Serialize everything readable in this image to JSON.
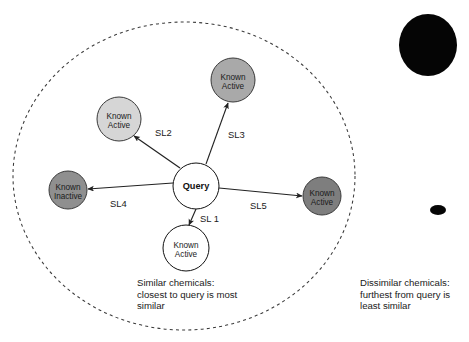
{
  "diagram": {
    "boundary": {
      "name": "similarity-boundary-ellipse",
      "style": "dashed",
      "cx": 184,
      "cy": 176,
      "rx": 171,
      "ry": 154,
      "color": "#3a3a3a"
    },
    "query_node": {
      "label": "Query",
      "cx": 196,
      "cy": 186,
      "r": 23,
      "fill": "#ffffff",
      "stroke": "#111111"
    },
    "nodes": [
      {
        "id": "known-active-upper-left",
        "line1": "Known",
        "line2": "Active",
        "cx": 119,
        "cy": 119,
        "r": 22,
        "fill": "#d6d6d6",
        "stroke": "#3a3a3a"
      },
      {
        "id": "known-active-top",
        "line1": "Known",
        "line2": "Active",
        "cx": 233,
        "cy": 80,
        "r": 22,
        "fill": "#a9a9a9",
        "stroke": "#3a3a3a"
      },
      {
        "id": "known-inactive-left",
        "line1": "Known",
        "line2": "Inactive",
        "cx": 68,
        "cy": 190,
        "r": 19,
        "fill": "#8f8f8f",
        "stroke": "#3a3a3a"
      },
      {
        "id": "known-active-right",
        "line1": "Known",
        "line2": "Active",
        "cx": 322,
        "cy": 196,
        "r": 19,
        "fill": "#7e7e7e",
        "stroke": "#3a3a3a"
      },
      {
        "id": "known-active-bottom",
        "line1": "Known",
        "line2": "Active",
        "cx": 186,
        "cy": 248,
        "r": 23,
        "fill": "#ffffff",
        "stroke": "#111111"
      }
    ],
    "edges": [
      {
        "id": "edge-sl1",
        "label": "SL 1",
        "label_x": 200,
        "label_y": 222,
        "x1": 196,
        "y1": 209,
        "x2": 189,
        "y2": 225
      },
      {
        "id": "edge-sl2",
        "label": "SL2",
        "label_x": 155,
        "label_y": 136,
        "x1": 180,
        "y1": 168,
        "x2": 134,
        "y2": 136
      },
      {
        "id": "edge-sl3",
        "label": "SL3",
        "label_x": 228,
        "label_y": 138,
        "x1": 206,
        "y1": 164,
        "x2": 228,
        "y2": 103
      },
      {
        "id": "edge-sl4",
        "label": "SL4",
        "label_x": 110,
        "label_y": 207,
        "x1": 173,
        "y1": 183,
        "x2": 88,
        "y2": 189
      },
      {
        "id": "edge-sl5",
        "label": "SL5",
        "label_x": 250,
        "label_y": 209,
        "x1": 219,
        "y1": 188,
        "x2": 302,
        "y2": 196
      }
    ],
    "outside_blobs": [
      {
        "id": "dissimilar-blob-large",
        "cx": 428,
        "cy": 45,
        "rx": 29,
        "ry": 31,
        "fill": "#050505"
      },
      {
        "id": "dissimilar-blob-small",
        "cx": 438,
        "cy": 210,
        "rx": 8,
        "ry": 5,
        "fill": "#050505"
      }
    ],
    "captions": [
      {
        "id": "caption-similar",
        "x": 137,
        "y": 286,
        "lines": [
          "Similar chemicals:",
          "closest to query is most",
          "similar"
        ]
      },
      {
        "id": "caption-dissimilar",
        "x": 360,
        "y": 286,
        "lines": [
          "Dissimilar chemicals:",
          "furthest from query is",
          "least similar"
        ]
      }
    ]
  }
}
